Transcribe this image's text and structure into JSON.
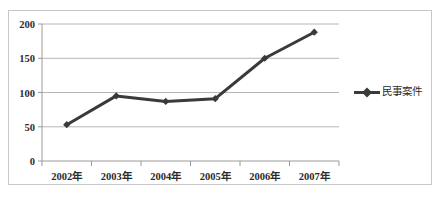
{
  "chart_data": {
    "type": "line",
    "title": "",
    "xlabel": "",
    "ylabel": "",
    "categories": [
      "2002年",
      "2003年",
      "2004年",
      "2005年",
      "2006年",
      "2007年"
    ],
    "series": [
      {
        "name": "民事案件",
        "values": [
          53,
          95,
          87,
          91,
          150,
          188
        ],
        "color": "#3a3a3a",
        "marker": "diamond"
      }
    ],
    "ylim": [
      0,
      200
    ],
    "yticks": [
      0,
      50,
      100,
      150,
      200
    ],
    "ytick_labels": [
      "0",
      "50",
      "100",
      "150",
      "200"
    ],
    "grid": "horizontal",
    "legend_position": "right",
    "legend_entries": [
      "民事案件"
    ]
  },
  "axis": {
    "y_labels": [
      "200",
      "150",
      "100",
      "50",
      "0"
    ],
    "x_labels": [
      "2002年",
      "2003年",
      "2004年",
      "2005年",
      "2006年",
      "2007年"
    ]
  },
  "legend": {
    "series_label": "民事案件"
  },
  "style": {
    "line_color": "#3a3a3a",
    "grid_color": "#b6b6b6",
    "axis_color": "#9a9a9a",
    "border_color": "#c8c8c8",
    "text_color": "#2b2b2b",
    "background": "#ffffff"
  }
}
